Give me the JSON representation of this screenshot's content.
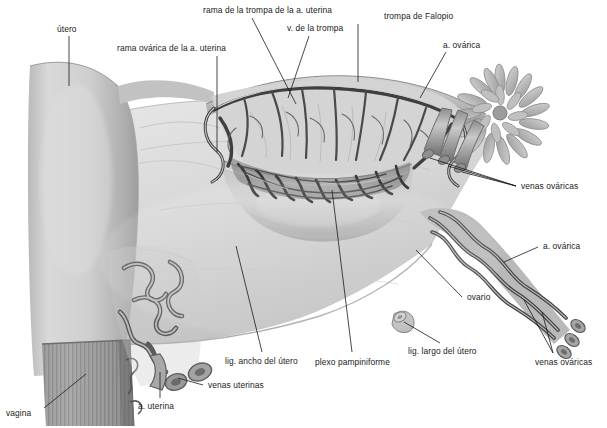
{
  "figure": {
    "language": "es",
    "style": "grayscale anatomical illustration",
    "width": 607,
    "height": 428,
    "background_color": "#ffffff",
    "label_color": "#1a1a1a",
    "leader_color": "#1a1a1a"
  },
  "labels": [
    {
      "id": "utero",
      "text": "útero"
    },
    {
      "id": "rama-ovarica",
      "text": "rama ovárica de la a. uterina"
    },
    {
      "id": "rama-trompa",
      "text": "rama de la trompa de la a. uterina"
    },
    {
      "id": "v-trompa",
      "text": "v. de la trompa"
    },
    {
      "id": "trompa-falopio",
      "text": "trompa de Falopio"
    },
    {
      "id": "a-ovarica-top",
      "text": "a. ovárica"
    },
    {
      "id": "venas-ovaricas-1",
      "text": "venas ováricas"
    },
    {
      "id": "a-ovarica-right",
      "text": "a. ovárica"
    },
    {
      "id": "ovario",
      "text": "ovario"
    },
    {
      "id": "venas-ovaricas-2",
      "text": "venas ováricas"
    },
    {
      "id": "lig-largo",
      "text": "lig. largo del útero"
    },
    {
      "id": "plexo",
      "text": "plexo pampiniforme"
    },
    {
      "id": "lig-ancho",
      "text": "lig. ancho del útero"
    },
    {
      "id": "venas-uterinas",
      "text": "venas uterinas"
    },
    {
      "id": "a-uterina",
      "text": "a. uterina"
    },
    {
      "id": "vagina",
      "text": "vagina"
    }
  ],
  "structures": [
    {
      "id": "uterus-body",
      "name": "cuerpo del útero"
    },
    {
      "id": "vaginal-wall",
      "name": "pared vaginal"
    },
    {
      "id": "broad-ligament",
      "name": "ligamento ancho del útero"
    },
    {
      "id": "fallopian-tube",
      "name": "trompa de Falopio"
    },
    {
      "id": "fimbriae",
      "name": "fimbrias"
    },
    {
      "id": "ovary",
      "name": "ovario"
    },
    {
      "id": "pampiniform-plexus",
      "name": "plexo pampiniforme"
    },
    {
      "id": "round-ligament",
      "name": "ligamento largo del útero"
    },
    {
      "id": "suspensory-bundle",
      "name": "vasos ováricos"
    },
    {
      "id": "uterine-vessels",
      "name": "vasos uterinos"
    }
  ]
}
